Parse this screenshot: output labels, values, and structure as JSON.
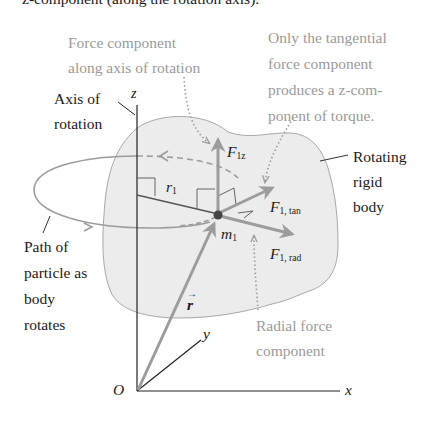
{
  "cutoff_header": "z-component (along the rotation axis).",
  "annotations": {
    "axis_component": [
      "Force component",
      "along axis of rotation"
    ],
    "tangential_note": [
      "Only the tangential",
      "force component",
      "produces a z-com-",
      "ponent of torque."
    ],
    "axis_label": [
      "Axis of",
      "rotation"
    ],
    "rigid_body": [
      "Rotating",
      "rigid",
      "body"
    ],
    "path_label": [
      "Path of",
      "particle as",
      "body",
      "rotates"
    ],
    "radial_note": [
      "Radial force",
      "component"
    ]
  },
  "symbols": {
    "z": "z",
    "x": "x",
    "y": "y",
    "origin": "O",
    "r_vec": "r",
    "r1": "r",
    "r1_sub": "1",
    "m1": "m",
    "m1_sub": "1",
    "F1z": "F",
    "F1z_sub": "1z",
    "F1tan": "F",
    "F1tan_sub": "1, tan",
    "F1rad": "F",
    "F1rad_sub": "1, rad"
  },
  "colors": {
    "body_fill": "#ececec",
    "body_outline": "#a8a8a8",
    "vector_gray": "#9c9c9c",
    "text_dark": "#1a1a1a",
    "text_gray": "#9a9a9a",
    "axis_dark": "#222222"
  }
}
